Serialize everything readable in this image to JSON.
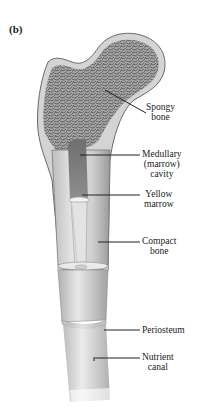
{
  "figure": {
    "panel_label": "(b)"
  },
  "labels": [
    {
      "id": "spongy-bone",
      "lines": [
        "Spongy",
        "bone"
      ]
    },
    {
      "id": "medullary-cavity",
      "lines": [
        "Medullary",
        "(marrow)",
        "cavity"
      ]
    },
    {
      "id": "yellow-marrow",
      "lines": [
        "Yellow",
        "marrow"
      ]
    },
    {
      "id": "compact-bone",
      "lines": [
        "Compact",
        "bone"
      ]
    },
    {
      "id": "periosteum",
      "lines": [
        "Periosteum"
      ]
    },
    {
      "id": "nutrient-canal",
      "lines": [
        "Nutrient",
        "canal"
      ]
    }
  ],
  "colors": {
    "spongy": "#8f8f8f",
    "compact": "#d2d2d2",
    "cavity": "#7d7d7d",
    "marrow": "#e4e4e4",
    "periosteum": "#c9c9c9",
    "outline": "#6a6a6a",
    "leader": "#222222"
  }
}
